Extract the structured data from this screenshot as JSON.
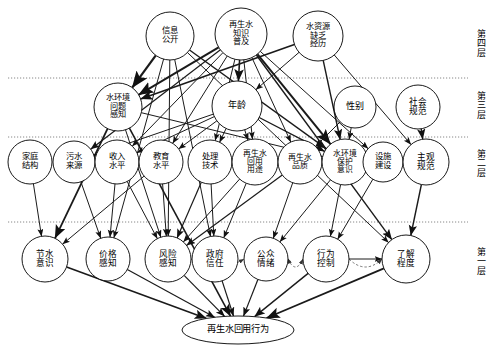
{
  "figure": {
    "type": "hierarchical-influence-diagram",
    "background": "#ffffff",
    "line_color": "#1a1a1a",
    "node_fill": "#ffffff",
    "node_stroke": "#000000"
  },
  "layers": [
    {
      "id": "layer4",
      "label": "第\n四\n层",
      "y_label": 30,
      "divider_y": 78
    },
    {
      "id": "layer3",
      "label": "第\n三\n层",
      "y_label": 92,
      "divider_y": 137
    },
    {
      "id": "layer2",
      "label": "第\n二\n层",
      "y_label": 150,
      "divider_y": 222
    },
    {
      "id": "layer1",
      "label": "第\n一\n层",
      "y_label": 248,
      "divider_y": null
    }
  ],
  "nodes": [
    {
      "id": "n_info_open",
      "label": "信息\n公开",
      "cx": 170,
      "cy": 36,
      "rx": 24,
      "ry": 24,
      "layer": "layer4",
      "font": 8.4
    },
    {
      "id": "n_knowledge",
      "label": "再生水\n知识\n普及",
      "cx": 241,
      "cy": 34,
      "rx": 26,
      "ry": 26,
      "layer": "layer4",
      "font": 8.2
    },
    {
      "id": "n_scarcity",
      "label": "水资源\n缺乏\n经历",
      "cx": 318,
      "cy": 36,
      "rx": 25,
      "ry": 25,
      "layer": "layer4",
      "font": 8.2
    },
    {
      "id": "n_env_percep",
      "label": "水环境\n问题\n感知",
      "cx": 118,
      "cy": 107,
      "rx": 24,
      "ry": 24,
      "layer": "layer3",
      "font": 8.2
    },
    {
      "id": "n_age",
      "label": "年龄",
      "cx": 237,
      "cy": 106,
      "rx": 25,
      "ry": 25,
      "layer": "layer3",
      "font": 9.0
    },
    {
      "id": "n_gender",
      "label": "性别",
      "cx": 355,
      "cy": 107,
      "rx": 21,
      "ry": 21,
      "layer": "layer3",
      "font": 9.0
    },
    {
      "id": "n_social_norm",
      "label": "社会\n规范",
      "cx": 418,
      "cy": 107,
      "rx": 22,
      "ry": 22,
      "layer": "layer3",
      "font": 8.6
    },
    {
      "id": "n_family",
      "label": "家庭\n结构",
      "cx": 30,
      "cy": 162,
      "rx": 22,
      "ry": 22,
      "layer": "layer2",
      "font": 8.4
    },
    {
      "id": "n_sewage_src",
      "label": "污水\n来源",
      "cx": 74,
      "cy": 162,
      "rx": 21,
      "ry": 21,
      "layer": "layer2",
      "font": 8.4
    },
    {
      "id": "n_income",
      "label": "收入\n水平",
      "cx": 117,
      "cy": 162,
      "rx": 22,
      "ry": 22,
      "layer": "layer2",
      "font": 8.4
    },
    {
      "id": "n_education",
      "label": "教育\n水平",
      "cx": 161,
      "cy": 162,
      "rx": 22,
      "ry": 22,
      "layer": "layer2",
      "font": 8.4
    },
    {
      "id": "n_treat_tech",
      "label": "处理\n技术",
      "cx": 210,
      "cy": 162,
      "rx": 22,
      "ry": 22,
      "layer": "layer2",
      "font": 8.4
    },
    {
      "id": "n_reuse_purpose",
      "label": "再生水\n回用\n用途",
      "cx": 255,
      "cy": 162,
      "rx": 23,
      "ry": 23,
      "layer": "layer2",
      "font": 7.8
    },
    {
      "id": "n_water_quality",
      "label": "再生水\n品质",
      "cx": 300,
      "cy": 162,
      "rx": 22,
      "ry": 22,
      "layer": "layer2",
      "font": 7.9
    },
    {
      "id": "n_env_protect",
      "label": "水环境\n保护\n意识",
      "cx": 345,
      "cy": 162,
      "rx": 23,
      "ry": 23,
      "layer": "layer2",
      "font": 7.8
    },
    {
      "id": "n_facility",
      "label": "设施\n建设",
      "cx": 383,
      "cy": 162,
      "rx": 20,
      "ry": 20,
      "layer": "layer2",
      "font": 8.4
    },
    {
      "id": "n_subj_norm",
      "label": "主观\n规范",
      "cx": 426,
      "cy": 162,
      "rx": 23,
      "ry": 23,
      "layer": "layer2",
      "font": 8.6
    },
    {
      "id": "n_save_water",
      "label": "节水\n意识",
      "cx": 45,
      "cy": 259,
      "rx": 23,
      "ry": 23,
      "layer": "layer1",
      "font": 8.6
    },
    {
      "id": "n_price_percep",
      "label": "价格\n感知",
      "cx": 108,
      "cy": 259,
      "rx": 22,
      "ry": 22,
      "layer": "layer1",
      "font": 8.6
    },
    {
      "id": "n_risk_percep",
      "label": "风险\n感知",
      "cx": 168,
      "cy": 259,
      "rx": 23,
      "ry": 23,
      "layer": "layer1",
      "font": 8.6
    },
    {
      "id": "n_gov_trust",
      "label": "政府\n信任",
      "cx": 215,
      "cy": 259,
      "rx": 23,
      "ry": 23,
      "layer": "layer1",
      "font": 8.6
    },
    {
      "id": "n_public_emo",
      "label": "公众\n情绪",
      "cx": 266,
      "cy": 259,
      "rx": 22,
      "ry": 22,
      "layer": "layer1",
      "font": 8.6
    },
    {
      "id": "n_behav_ctrl",
      "label": "行为\n控制",
      "cx": 326,
      "cy": 259,
      "rx": 23,
      "ry": 23,
      "layer": "layer1",
      "font": 8.6
    },
    {
      "id": "n_awareness",
      "label": "了解\n程度",
      "cx": 406,
      "cy": 259,
      "rx": 24,
      "ry": 24,
      "layer": "layer1",
      "font": 8.6
    },
    {
      "id": "n_behavior",
      "label": "再生水回用行为",
      "cx": 238,
      "cy": 330,
      "rx": 56,
      "ry": 14,
      "layer": "outcome",
      "font": 9.2
    }
  ],
  "edges": [
    {
      "from": "n_info_open",
      "to": "n_env_percep",
      "style": "solid",
      "weight": 2.2
    },
    {
      "from": "n_info_open",
      "to": "n_price_percep",
      "style": "solid",
      "weight": 1.0
    },
    {
      "from": "n_info_open",
      "to": "n_risk_percep",
      "style": "solid",
      "weight": 1.0
    },
    {
      "from": "n_info_open",
      "to": "n_gov_trust",
      "style": "solid",
      "weight": 1.0
    },
    {
      "from": "n_info_open",
      "to": "n_env_protect",
      "style": "solid",
      "weight": 1.4
    },
    {
      "from": "n_info_open",
      "to": "n_awareness",
      "style": "solid",
      "weight": 1.0
    },
    {
      "from": "n_knowledge",
      "to": "n_env_percep",
      "style": "solid",
      "weight": 2.0
    },
    {
      "from": "n_knowledge",
      "to": "n_age",
      "style": "solid",
      "weight": 1.6
    },
    {
      "from": "n_knowledge",
      "to": "n_income",
      "style": "solid",
      "weight": 1.0
    },
    {
      "from": "n_knowledge",
      "to": "n_education",
      "style": "solid",
      "weight": 1.0
    },
    {
      "from": "n_knowledge",
      "to": "n_treat_tech",
      "style": "solid",
      "weight": 1.0
    },
    {
      "from": "n_knowledge",
      "to": "n_reuse_purpose",
      "style": "solid",
      "weight": 1.0
    },
    {
      "from": "n_knowledge",
      "to": "n_water_quality",
      "style": "solid",
      "weight": 1.0
    },
    {
      "from": "n_knowledge",
      "to": "n_env_protect",
      "style": "solid",
      "weight": 2.0
    },
    {
      "from": "n_knowledge",
      "to": "n_facility",
      "style": "solid",
      "weight": 1.0
    },
    {
      "from": "n_knowledge",
      "to": "n_sewage_src",
      "style": "solid",
      "weight": 1.2
    },
    {
      "from": "n_knowledge",
      "to": "n_awareness",
      "style": "solid",
      "weight": 1.4
    },
    {
      "from": "n_scarcity",
      "to": "n_env_percep",
      "style": "solid",
      "weight": 1.6
    },
    {
      "from": "n_scarcity",
      "to": "n_age",
      "style": "solid",
      "weight": 1.0
    },
    {
      "from": "n_scarcity",
      "to": "n_env_protect",
      "style": "solid",
      "weight": 1.4
    },
    {
      "from": "n_scarcity",
      "to": "n_subj_norm",
      "style": "solid",
      "weight": 1.0
    },
    {
      "from": "n_env_percep",
      "to": "n_save_water",
      "style": "solid",
      "weight": 1.8
    },
    {
      "from": "n_env_percep",
      "to": "n_risk_percep",
      "style": "solid",
      "weight": 1.0
    },
    {
      "from": "n_env_percep",
      "to": "n_env_protect",
      "style": "solid",
      "weight": 1.0
    },
    {
      "from": "n_env_percep",
      "to": "n_behavior",
      "style": "solid",
      "weight": 1.6
    },
    {
      "from": "n_age",
      "to": "n_income",
      "style": "solid",
      "weight": 1.0
    },
    {
      "from": "n_age",
      "to": "n_education",
      "style": "solid",
      "weight": 1.0
    },
    {
      "from": "n_age",
      "to": "n_sewage_src",
      "style": "solid",
      "weight": 1.0
    },
    {
      "from": "n_age",
      "to": "n_treat_tech",
      "style": "solid",
      "weight": 1.0
    },
    {
      "from": "n_age",
      "to": "n_reuse_purpose",
      "style": "solid",
      "weight": 1.0
    },
    {
      "from": "n_age",
      "to": "n_env_protect",
      "style": "solid",
      "weight": 1.4
    },
    {
      "from": "n_gender",
      "to": "n_env_protect",
      "style": "solid",
      "weight": 1.0
    },
    {
      "from": "n_gender",
      "to": "n_water_quality",
      "style": "solid",
      "weight": 1.0
    },
    {
      "from": "n_social_norm",
      "to": "n_subj_norm",
      "style": "solid",
      "weight": 1.4
    },
    {
      "from": "n_family",
      "to": "n_save_water",
      "style": "solid",
      "weight": 1.0
    },
    {
      "from": "n_sewage_src",
      "to": "n_price_percep",
      "style": "solid",
      "weight": 1.0
    },
    {
      "from": "n_income",
      "to": "n_price_percep",
      "style": "solid",
      "weight": 1.0
    },
    {
      "from": "n_income",
      "to": "n_risk_percep",
      "style": "solid",
      "weight": 1.0
    },
    {
      "from": "n_education",
      "to": "n_risk_percep",
      "style": "solid",
      "weight": 1.0
    },
    {
      "from": "n_education",
      "to": "n_save_water",
      "style": "solid",
      "weight": 1.0
    },
    {
      "from": "n_treat_tech",
      "to": "n_risk_percep",
      "style": "solid",
      "weight": 1.2
    },
    {
      "from": "n_treat_tech",
      "to": "n_gov_trust",
      "style": "solid",
      "weight": 1.0
    },
    {
      "from": "n_reuse_purpose",
      "to": "n_risk_percep",
      "style": "solid",
      "weight": 1.0
    },
    {
      "from": "n_reuse_purpose",
      "to": "n_gov_trust",
      "style": "solid",
      "weight": 1.0
    },
    {
      "from": "n_water_quality",
      "to": "n_risk_percep",
      "style": "solid",
      "weight": 1.2
    },
    {
      "from": "n_water_quality",
      "to": "n_public_emo",
      "style": "solid",
      "weight": 1.0
    },
    {
      "from": "n_env_protect",
      "to": "n_behav_ctrl",
      "style": "solid",
      "weight": 1.0
    },
    {
      "from": "n_env_protect",
      "to": "n_public_emo",
      "style": "solid",
      "weight": 1.0
    },
    {
      "from": "n_facility",
      "to": "n_behav_ctrl",
      "style": "solid",
      "weight": 1.0
    },
    {
      "from": "n_subj_norm",
      "to": "n_awareness",
      "style": "solid",
      "weight": 1.4
    },
    {
      "from": "n_behav_ctrl",
      "to": "n_awareness",
      "style": "solid",
      "weight": 1.0
    },
    {
      "from": "n_public_emo",
      "to": "n_behav_ctrl",
      "style": "dashed",
      "weight": 1.0,
      "bidirectional": true
    },
    {
      "from": "n_risk_percep",
      "to": "n_public_emo",
      "style": "dashed",
      "weight": 1.0
    },
    {
      "from": "n_behav_ctrl",
      "to": "n_awareness",
      "style": "dashed",
      "weight": 1.0
    },
    {
      "from": "n_save_water",
      "to": "n_behavior",
      "style": "solid",
      "weight": 1.6
    },
    {
      "from": "n_price_percep",
      "to": "n_behavior",
      "style": "solid",
      "weight": 1.2
    },
    {
      "from": "n_risk_percep",
      "to": "n_behavior",
      "style": "solid",
      "weight": 1.2
    },
    {
      "from": "n_gov_trust",
      "to": "n_behavior",
      "style": "solid",
      "weight": 1.2
    },
    {
      "from": "n_public_emo",
      "to": "n_behavior",
      "style": "solid",
      "weight": 1.2
    },
    {
      "from": "n_behav_ctrl",
      "to": "n_behavior",
      "style": "solid",
      "weight": 1.4
    },
    {
      "from": "n_awareness",
      "to": "n_behavior",
      "style": "solid",
      "weight": 1.8
    }
  ]
}
